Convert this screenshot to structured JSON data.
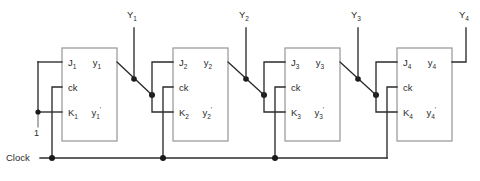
{
  "diagram": {
    "clock_label": "Clock",
    "logic_one_label": "1",
    "colors": {
      "wire": "#2b2b2b",
      "box_stroke": "#9a9a9a",
      "background": "#ffffff",
      "junction": "#1a1a1a"
    },
    "external_inputs": [
      {
        "name": "Y1",
        "base": "Y",
        "sub": "1"
      },
      {
        "name": "Y2",
        "base": "Y",
        "sub": "2"
      },
      {
        "name": "Y3",
        "base": "Y",
        "sub": "3"
      },
      {
        "name": "Y4",
        "base": "Y",
        "sub": "4"
      }
    ],
    "flipflops": [
      {
        "index": "1",
        "j_base": "J",
        "j_sub": "1",
        "ck": "ck",
        "k_base": "K",
        "k_sub": "1",
        "q_base": "y",
        "q_sub": "1",
        "qn_base": "y",
        "qn_sub": "1",
        "qn_prime": "'"
      },
      {
        "index": "2",
        "j_base": "J",
        "j_sub": "2",
        "ck": "ck",
        "k_base": "K",
        "k_sub": "2",
        "q_base": "y",
        "q_sub": "2",
        "qn_base": "y",
        "qn_sub": "2",
        "qn_prime": "'"
      },
      {
        "index": "3",
        "j_base": "J",
        "j_sub": "3",
        "ck": "ck",
        "k_base": "K",
        "k_sub": "3",
        "q_base": "y",
        "q_sub": "3",
        "qn_base": "y",
        "qn_sub": "3",
        "qn_prime": "'"
      },
      {
        "index": "4",
        "j_base": "J",
        "j_sub": "4",
        "ck": "ck",
        "k_base": "K",
        "k_sub": "4",
        "q_base": "y",
        "q_sub": "4",
        "qn_base": "y",
        "qn_sub": "4",
        "qn_prime": "'"
      }
    ]
  }
}
